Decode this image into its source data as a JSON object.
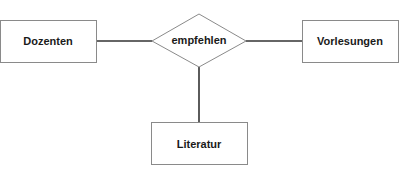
{
  "diagram": {
    "type": "entity-relationship",
    "entities": [
      {
        "id": "dozenten",
        "label": "Dozenten"
      },
      {
        "id": "vorlesungen",
        "label": "Vorlesungen"
      },
      {
        "id": "literatur",
        "label": "Literatur"
      }
    ],
    "relationships": [
      {
        "id": "empfehlen",
        "label": "empfehlen",
        "connects": [
          "dozenten",
          "vorlesungen",
          "literatur"
        ]
      }
    ],
    "colors": {
      "box_border": "#8a8a8a",
      "line": "#333333",
      "text": "#1a1a1a"
    }
  }
}
